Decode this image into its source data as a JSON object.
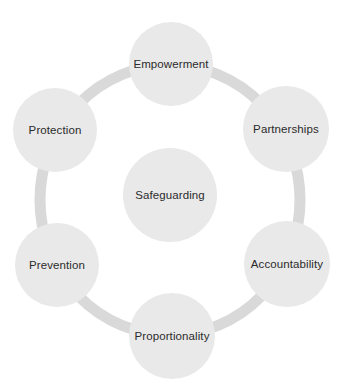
{
  "diagram": {
    "colors": {
      "background": "#ffffff",
      "node_fill": "#e9e9e9",
      "ring": "#d9d9d9",
      "text": "#2b2b2b"
    },
    "ring": {
      "cx": 170,
      "cy": 200,
      "rx": 130,
      "ry": 135,
      "stroke_width": 11
    },
    "center": {
      "label": "Safeguarding",
      "cx": 170,
      "cy": 195,
      "r": 47
    },
    "nodes": [
      {
        "label": "Empowerment",
        "cx": 171,
        "cy": 64,
        "r": 42
      },
      {
        "label": "Partnerships",
        "cx": 286,
        "cy": 129,
        "r": 43
      },
      {
        "label": "Accountability",
        "cx": 287,
        "cy": 264,
        "r": 43
      },
      {
        "label": "Proportionality",
        "cx": 172,
        "cy": 336,
        "r": 43
      },
      {
        "label": "Prevention",
        "cx": 57,
        "cy": 265,
        "r": 42
      },
      {
        "label": "Protection",
        "cx": 55,
        "cy": 130,
        "r": 42
      }
    ]
  }
}
